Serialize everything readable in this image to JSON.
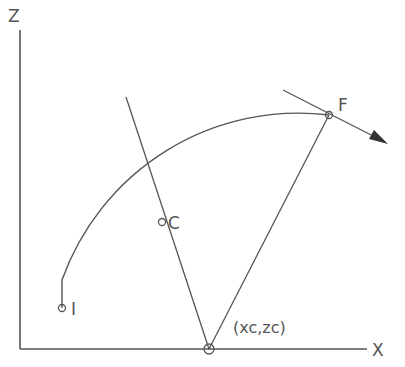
{
  "diagram": {
    "type": "circular-arc-geometry",
    "colors": {
      "line": "#555555",
      "background": "#ffffff"
    },
    "axes": {
      "x_label": "X",
      "z_label": "Z",
      "origin": [
        20,
        349
      ],
      "x_end": [
        367,
        349
      ],
      "z_end": [
        20,
        30
      ]
    },
    "points": {
      "start": {
        "label": "I",
        "pos": [
          62,
          308
        ]
      },
      "mid": {
        "label": "C",
        "pos": [
          162,
          222
        ]
      },
      "end": {
        "label": "F",
        "pos": [
          329,
          115
        ]
      },
      "center": {
        "label": "(xc,zc)",
        "pos": [
          209,
          349
        ]
      }
    },
    "arc": {
      "from": "I",
      "to": "F",
      "center": "(xc,zc)",
      "direction": "clockwise"
    },
    "bisector_line": {
      "from": [
        126,
        97
      ],
      "to": [
        209,
        349
      ],
      "through": "C"
    },
    "radius_line": {
      "from": [
        209,
        349
      ],
      "to": [
        329,
        115
      ]
    },
    "tangent_arrow": {
      "from": [
        283,
        90
      ],
      "to": [
        388,
        144
      ]
    }
  }
}
